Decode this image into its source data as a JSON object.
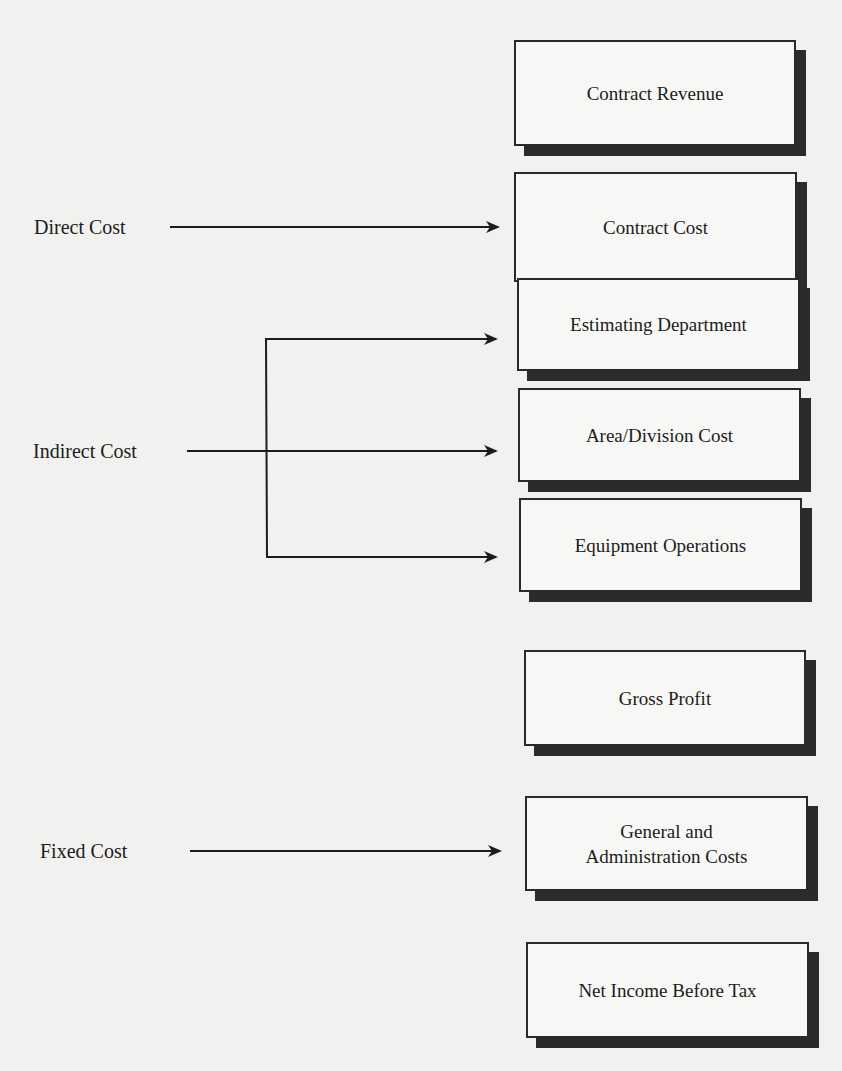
{
  "diagram": {
    "title": "",
    "boxes": [
      {
        "id": "contract-revenue",
        "label": "Contract Revenue"
      },
      {
        "id": "contract-cost",
        "label": "Contract Cost"
      },
      {
        "id": "estimating-department",
        "label": "Estimating Department"
      },
      {
        "id": "area-division-cost",
        "label": "Area/Division Cost"
      },
      {
        "id": "equipment-operations",
        "label": "Equipment Operations"
      },
      {
        "id": "gross-profit",
        "label": "Gross Profit"
      },
      {
        "id": "general-administration-costs",
        "label_line1": "General and",
        "label_line2": "Administration Costs"
      },
      {
        "id": "net-income-before-tax",
        "label": "Net Income Before Tax"
      }
    ],
    "sources": [
      {
        "id": "direct-cost",
        "label": "Direct Cost",
        "targets": [
          "contract-cost"
        ]
      },
      {
        "id": "indirect-cost",
        "label": "Indirect Cost",
        "targets": [
          "estimating-department",
          "area-division-cost",
          "equipment-operations"
        ]
      },
      {
        "id": "fixed-cost",
        "label": "Fixed Cost",
        "targets": [
          "general-administration-costs"
        ]
      }
    ]
  }
}
